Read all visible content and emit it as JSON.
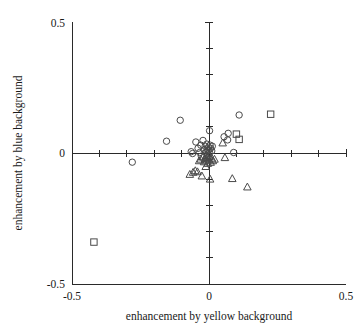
{
  "chart_data": {
    "type": "scatter",
    "title": "",
    "xlabel": "enhancement by yellow background",
    "ylabel": "enhancement by blue background",
    "xlim": [
      -0.5,
      0.5
    ],
    "ylim": [
      -0.5,
      0.5
    ],
    "grid": false,
    "legend": null,
    "x_tick_labels": [
      "-0.5",
      "0",
      "0.5"
    ],
    "y_tick_labels": [
      "-0.5",
      "0",
      "0.5"
    ],
    "x_tick_values": [
      -0.5,
      0,
      0.5
    ],
    "y_tick_values": [
      -0.5,
      0,
      0.5
    ],
    "x_minor_tick_values": [
      -0.4,
      -0.3,
      -0.2,
      -0.1,
      0.1,
      0.2,
      0.3,
      0.4
    ],
    "y_minor_tick_values": [
      -0.4,
      -0.3,
      -0.2,
      -0.1,
      0.1,
      0.2,
      0.3,
      0.4
    ],
    "axes_style": "centered-cross-with-left-and-bottom-spines",
    "series": [
      {
        "name": "circle",
        "marker": "circle",
        "points": [
          [
            -0.28,
            -0.035
          ],
          [
            -0.155,
            0.045
          ],
          [
            -0.105,
            0.125
          ],
          [
            -0.065,
            0.005
          ],
          [
            -0.06,
            -0.002
          ],
          [
            -0.048,
            0.042
          ],
          [
            -0.04,
            0.018
          ],
          [
            -0.034,
            0.002
          ],
          [
            -0.03,
            0.03
          ],
          [
            -0.028,
            -0.012
          ],
          [
            -0.022,
            0.048
          ],
          [
            -0.018,
            0.012
          ],
          [
            -0.014,
            0.026
          ],
          [
            -0.01,
            0.004
          ],
          [
            -0.008,
            0.034
          ],
          [
            -0.006,
            0.016
          ],
          [
            -0.004,
            0.008
          ],
          [
            -0.002,
            0.022
          ],
          [
            0.0,
            0.012
          ],
          [
            0.002,
            0.002
          ],
          [
            0.004,
            0.03
          ],
          [
            0.006,
            0.018
          ],
          [
            0.01,
            0.008
          ],
          [
            0.012,
            0.026
          ],
          [
            0.002,
            0.085
          ],
          [
            0.055,
            0.062
          ],
          [
            0.068,
            0.05
          ],
          [
            0.07,
            0.075
          ],
          [
            0.09,
            0.002
          ],
          [
            0.11,
            0.145
          ]
        ]
      },
      {
        "name": "square",
        "marker": "square",
        "points": [
          [
            -0.42,
            -0.34
          ],
          [
            0.1,
            0.072
          ],
          [
            0.11,
            0.052
          ],
          [
            0.225,
            0.148
          ]
        ]
      },
      {
        "name": "triangle",
        "marker": "triangle",
        "points": [
          [
            -0.07,
            -0.082
          ],
          [
            -0.058,
            -0.074
          ],
          [
            -0.05,
            -0.068
          ],
          [
            -0.042,
            -0.072
          ],
          [
            -0.036,
            -0.03
          ],
          [
            -0.03,
            -0.024
          ],
          [
            -0.026,
            -0.088
          ],
          [
            -0.022,
            -0.016
          ],
          [
            -0.018,
            -0.034
          ],
          [
            -0.014,
            -0.022
          ],
          [
            -0.012,
            -0.052
          ],
          [
            -0.01,
            -0.01
          ],
          [
            -0.008,
            -0.028
          ],
          [
            -0.006,
            -0.018
          ],
          [
            -0.004,
            -0.04
          ],
          [
            -0.002,
            -0.008
          ],
          [
            0.0,
            -0.026
          ],
          [
            0.002,
            -0.014
          ],
          [
            0.004,
            -0.1
          ],
          [
            0.006,
            -0.036
          ],
          [
            0.01,
            -0.02
          ],
          [
            0.014,
            -0.03
          ],
          [
            0.02,
            -0.024
          ],
          [
            0.05,
            0.038
          ],
          [
            0.058,
            -0.018
          ],
          [
            0.085,
            -0.098
          ],
          [
            0.14,
            -0.13
          ]
        ]
      }
    ]
  },
  "axis_numbers": {
    "y_top": "0.5",
    "y_zero": "0",
    "y_bottom": "-0.5",
    "x_left": "-0.5",
    "x_zero": "0",
    "x_right": "0.5"
  }
}
